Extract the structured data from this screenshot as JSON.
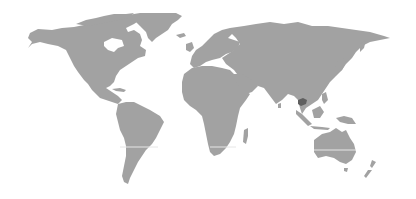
{
  "map": {
    "title": "World map",
    "projection": "equirectangular",
    "land_color": "#a2a2a2",
    "background_color": "#ffffff",
    "highlight": {
      "region": "Cambodia",
      "color": "#5f5f5f"
    },
    "reference_line": {
      "name": "Tropic of Capricorn",
      "color": "#e6e6e6"
    },
    "continents": [
      "North America",
      "South America",
      "Europe",
      "Africa",
      "Asia",
      "Australia",
      "Greenland",
      "New Zealand"
    ]
  }
}
